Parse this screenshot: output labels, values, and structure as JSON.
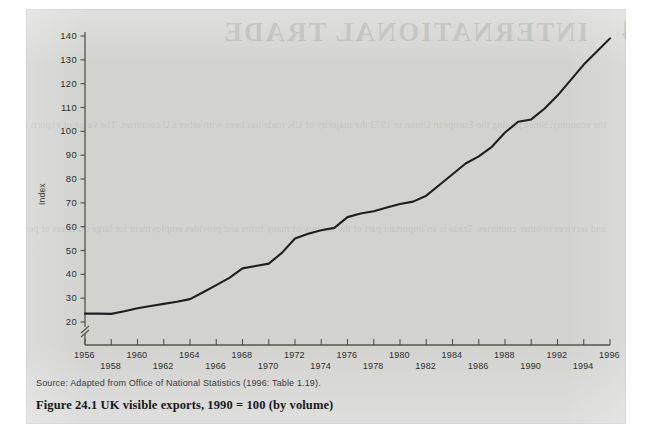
{
  "figure": {
    "caption": "Figure 24.1  UK visible exports, 1990 = 100 (by volume)",
    "source": "Source: Adapted from Office of National Statistics (1996: Table 1.19).",
    "ghost_title": "INTERNATIONAL TRADE",
    "ghost_number": "24",
    "ghost_paragraph_1": "the economy. Since joining the European Union in 1973 the majority of UK trade has been with other EU countries. The value of exports rose in the period to 1996 and the balance of payments also improved. Imports also grew rapidly. Manufactured goods dominate both exports and imports.",
    "ghost_paragraph_2": "and services to other countries. Trade is an important part of the activity of many firms and provides employment for large numbers of people in the United Kingdom economy."
  },
  "chart_data": {
    "type": "line",
    "title": "UK visible exports, 1990 = 100 (by volume)",
    "xlabel": "",
    "ylabel": "Index",
    "ylim": [
      20,
      140
    ],
    "xlim": [
      1956,
      1996
    ],
    "grid": false,
    "legend": null,
    "y_axis_break": true,
    "y_ticks": [
      20,
      30,
      40,
      50,
      60,
      70,
      80,
      90,
      100,
      110,
      120,
      130,
      140
    ],
    "x_ticks": [
      1956,
      1958,
      1960,
      1962,
      1964,
      1966,
      1968,
      1970,
      1972,
      1974,
      1976,
      1978,
      1980,
      1982,
      1984,
      1986,
      1988,
      1990,
      1992,
      1994,
      1996
    ],
    "x": [
      1956,
      1957,
      1958,
      1959,
      1960,
      1961,
      1962,
      1963,
      1964,
      1965,
      1966,
      1967,
      1968,
      1969,
      1970,
      1971,
      1972,
      1973,
      1974,
      1975,
      1976,
      1977,
      1978,
      1979,
      1980,
      1981,
      1982,
      1983,
      1984,
      1985,
      1986,
      1987,
      1988,
      1989,
      1990,
      1991,
      1992,
      1993,
      1994,
      1995,
      1996
    ],
    "values": [
      23.5,
      23.5,
      23.4,
      24.5,
      25.8,
      26.7,
      27.6,
      28.5,
      29.6,
      32.5,
      35.5,
      38.5,
      42.5,
      43.5,
      44.5,
      49.0,
      55.0,
      57.0,
      58.5,
      59.5,
      64.0,
      65.5,
      66.5,
      68.0,
      69.5,
      70.5,
      73.0,
      77.5,
      82.0,
      86.5,
      89.5,
      93.5,
      99.5,
      104.0,
      105.0,
      109.5,
      115.0,
      121.5,
      128.0,
      133.5,
      139.0
    ],
    "series_name": "UK visible exports index"
  },
  "yticks_display": [
    "140",
    "130",
    "120",
    "110",
    "100",
    "90",
    "80",
    "70",
    "60",
    "50",
    "40",
    "30",
    "20"
  ],
  "xticks_upper": [
    "1956",
    "1960",
    "1964",
    "1968",
    "1972",
    "1976",
    "1980",
    "1984",
    "1988",
    "1992",
    "1996"
  ],
  "xticks_lower": [
    "1958",
    "1962",
    "1966",
    "1970",
    "1974",
    "1978",
    "1982",
    "1986",
    "1990",
    "1994"
  ],
  "colors": {
    "paper": "#d2d2cf",
    "ink": "#1f1f20",
    "axis": "#55554f",
    "text": "#2e2e2f"
  }
}
